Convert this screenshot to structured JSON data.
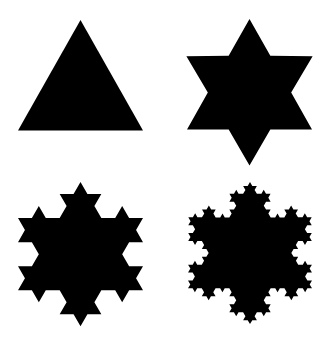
{
  "colors": {
    "background": "#ffffff",
    "fill": "#000000"
  },
  "figures": [
    {
      "name": "koch-iteration-0",
      "label": "Iteration 0 (triangle)",
      "iteration": 0,
      "apex_x": 80.5,
      "apex_y": 20,
      "side": 125,
      "vscale": 1.02
    },
    {
      "name": "koch-iteration-1",
      "label": "Iteration 1 (star)",
      "iteration": 1,
      "apex_x": 249.5,
      "apex_y": 19,
      "side": 125,
      "vscale": 1.02
    },
    {
      "name": "koch-iteration-2",
      "label": "Iteration 2",
      "iteration": 2,
      "apex_x": 80.5,
      "apex_y": 182,
      "side": 125,
      "vscale": 1.0
    },
    {
      "name": "koch-iteration-3",
      "label": "Iteration 3",
      "iteration": 3,
      "apex_x": 250,
      "apex_y": 182,
      "side": 124,
      "vscale": 0.99
    }
  ]
}
